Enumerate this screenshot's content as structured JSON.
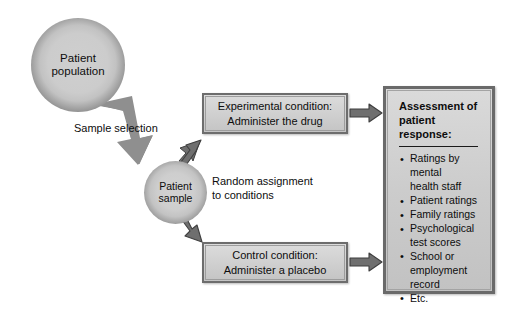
{
  "diagram": {
    "nodes": {
      "population": {
        "line1": "Patient",
        "line2": "population"
      },
      "sample": {
        "line1": "Patient",
        "line2": "sample"
      },
      "experimental": {
        "line1": "Experimental condition:",
        "line2": "Administer the drug"
      },
      "control": {
        "line1": "Control condition:",
        "line2": "Administer a placebo"
      },
      "assessment": {
        "title_line1": "Assessment of",
        "title_line2": "patient response:",
        "items": [
          "Ratings by\nmental\nhealth staff",
          "Patient ratings",
          "Family ratings",
          "Psychological\ntest scores",
          "School or\nemployment\nrecord",
          "Etc."
        ]
      }
    },
    "edges": {
      "sample_selection": "Sample selection",
      "random_assignment": "Random assignment\nto conditions"
    },
    "colors": {
      "background": "#ffffff",
      "box_fill": "#cfcfcf",
      "box_border": "#6d6d6d",
      "arrow_fill": "#7a7a7a",
      "arrow_stroke": "#3c3c3c",
      "text": "#0d0d0d",
      "circle_center": "#cfcfcf",
      "circle_rim": "#141414"
    }
  }
}
